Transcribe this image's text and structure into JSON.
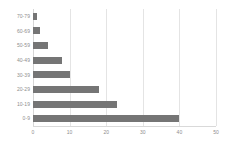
{
  "chart_data": {
    "type": "bar",
    "orientation": "horizontal",
    "title": "",
    "subtitle": "",
    "xlabel": "",
    "ylabel": "",
    "categories": [
      "70-79",
      "60-69",
      "50-59",
      "40-49",
      "30-39",
      "20-29",
      "10-19",
      "0-9"
    ],
    "values": [
      1,
      2,
      4,
      8,
      10,
      18,
      23,
      40
    ],
    "xlim": [
      0,
      50
    ],
    "xticks": [
      0,
      10,
      20,
      30,
      40,
      50
    ],
    "xtick_labels": [
      "0",
      "10",
      "20",
      "30",
      "40",
      "50"
    ],
    "grid": "vertical",
    "legend": "none",
    "bar_color": "#757575",
    "gridline_color": "#e4e4e4",
    "axis_text_color": "#8e8e8e",
    "background_color": "#ffffff"
  }
}
